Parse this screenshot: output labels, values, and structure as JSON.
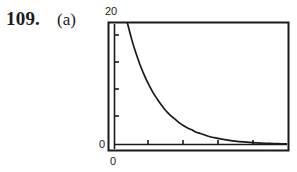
{
  "figure": {
    "problem_number": "109.",
    "part_label": "(a)"
  },
  "chart_data": {
    "type": "line",
    "title": "",
    "subtitle": "",
    "xlabel": "",
    "ylabel": "",
    "grid": false,
    "legend": null,
    "xlim": [
      0,
      10
    ],
    "ylim": [
      0,
      20
    ],
    "x_tick_labels": [
      "0"
    ],
    "y_tick_labels": [
      "0",
      "20"
    ],
    "y_axis_max_label": "20",
    "y_axis_min_label": "0",
    "x_axis_min_label": "0",
    "x_tick_count": 4,
    "y_tick_count": 4,
    "series": [
      {
        "name": "decay",
        "x": [
          0.75,
          1.0,
          1.25,
          1.5,
          1.75,
          2.0,
          2.25,
          2.5,
          2.75,
          3.0,
          3.25,
          3.5,
          3.75,
          4.0,
          4.25,
          4.5,
          4.75,
          5.0,
          5.5,
          6.0,
          6.5,
          7.0,
          7.5,
          8.0,
          8.5,
          9.0,
          9.5,
          10.0
        ],
        "y": [
          20.0,
          17.3,
          15.0,
          13.0,
          11.3,
          9.8,
          8.5,
          7.4,
          6.4,
          5.5,
          4.8,
          4.2,
          3.6,
          3.1,
          2.7,
          2.4,
          2.0,
          1.8,
          1.3,
          1.0,
          0.75,
          0.55,
          0.4,
          0.3,
          0.22,
          0.16,
          0.12,
          0.09
        ]
      }
    ],
    "colors": {
      "curve": "#1a1a1a",
      "frame": "#1a1a1a",
      "background": "#ffffff"
    }
  }
}
